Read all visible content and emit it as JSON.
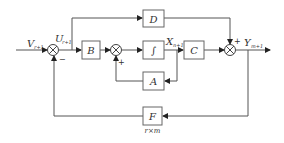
{
  "diagram": {
    "blocks": [
      {
        "id": "B",
        "label": "B"
      },
      {
        "id": "D",
        "label": "D"
      },
      {
        "id": "integrator",
        "label": "∫"
      },
      {
        "id": "C",
        "label": "C"
      },
      {
        "id": "A",
        "label": "A"
      },
      {
        "id": "F",
        "label": "F"
      }
    ],
    "signals": {
      "input": {
        "base": "V",
        "sub": "r+1"
      },
      "u": {
        "base": "U",
        "sub": "r+1"
      },
      "x": {
        "base": "X",
        "sub": "n+1"
      },
      "output": {
        "base": "Y",
        "sub": "m+1"
      }
    },
    "signs": {
      "sum1_bottom": "−",
      "sum2_bottom": "+",
      "sum3_top": "+"
    },
    "f_dimension_note": "r×m"
  }
}
